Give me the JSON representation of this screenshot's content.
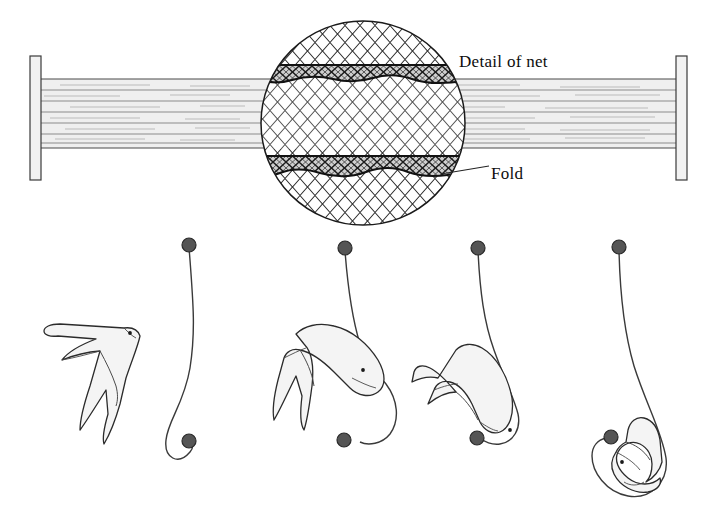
{
  "figure": {
    "type": "diagram",
    "background_color": "#ffffff",
    "ink_color": "#111111"
  },
  "labels": {
    "detail_of_net": "Detail of net",
    "fold": "Fold"
  },
  "net_panel": {
    "name": "mist-net-panel",
    "description": "Horizontal mist net strung between two vertical poles, with a magnified circular detail view at centre",
    "left_pole": {
      "x": 30,
      "y": 56,
      "width": 11,
      "height": 124,
      "fill": "#f2f2f2",
      "stroke": "#3a3a3a"
    },
    "right_pole": {
      "x": 676,
      "y": 56,
      "width": 11,
      "height": 124,
      "fill": "#f2f2f2",
      "stroke": "#3a3a3a"
    },
    "net_band": {
      "top": 79,
      "bottom": 148,
      "fill": "#efefef",
      "stroke": "#5a5a5a"
    },
    "shelf_line_count": 6,
    "detail_circle": {
      "cx": 363,
      "cy": 123,
      "r": 102,
      "stroke": "#1a1a1a",
      "mesh_color": "#2b2b2b"
    },
    "folds": [
      {
        "name": "upper-fold",
        "top_y": 65,
        "bottom_y": 81,
        "fill": "#6f6f6f"
      },
      {
        "name": "lower-fold",
        "top_y": 156,
        "bottom_y": 173,
        "fill": "#6f6f6f"
      }
    ]
  },
  "sequence": {
    "name": "capture-sequence",
    "description": "Four stages showing a bird flying into a mist net and falling into the net pocket",
    "stage_count": 4,
    "bird_fill": "#f4f4f4",
    "bird_stroke": "#2b2b2b",
    "knot_fill": "#555555",
    "knot_stroke": "#2a2a2a",
    "stages": [
      {
        "index": 1,
        "name": "stage-1-bird-in-flight",
        "caption": "",
        "bird_state": "flying free beside open net"
      },
      {
        "index": 2,
        "name": "stage-2-bird-strikes-net",
        "caption": "",
        "bird_state": "striking the net, net deflecting"
      },
      {
        "index": 3,
        "name": "stage-3-bird-sliding",
        "caption": "",
        "bird_state": "sliding down into the pocket"
      },
      {
        "index": 4,
        "name": "stage-4-bird-in-pocket",
        "caption": "",
        "bird_state": "enveloped in the net pocket"
      }
    ]
  }
}
